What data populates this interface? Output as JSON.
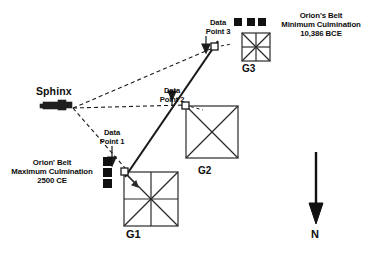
{
  "figure": {
    "landmarks": {
      "sphinx_label": "Sphinx"
    },
    "pyramids": [
      {
        "id": "g1",
        "label": "G1"
      },
      {
        "id": "g2",
        "label": "G2"
      },
      {
        "id": "g3",
        "label": "G3"
      }
    ],
    "data_points": [
      {
        "id": "dp1",
        "label": "Data\nPoint 1"
      },
      {
        "id": "dp2",
        "label": "Data\nPoint 2"
      },
      {
        "id": "dp3",
        "label": "Data\nPoint 3"
      }
    ],
    "annotations": {
      "minimum_culmination": "Orion's Belt\nMinimum Culmination\n10,386 BCE",
      "maximum_culmination": "Orion' Belt\nMaximum Culmination\n2500 CE"
    },
    "compass": {
      "direction_label": "N"
    },
    "colors": {
      "line": "#1a1a1a",
      "text": "#0d0d0d",
      "star": "#111111",
      "background": "#ffffff"
    }
  }
}
